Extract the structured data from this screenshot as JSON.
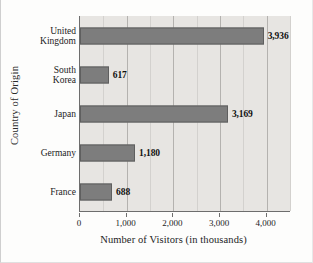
{
  "chart_data": {
    "type": "bar",
    "orientation": "horizontal",
    "title": "",
    "xlabel": "Number of Visitors (in thousands)",
    "ylabel": "Country of Origin",
    "categories": [
      "United Kingdom",
      "South Korea",
      "Japan",
      "Germany",
      "France"
    ],
    "values": [
      3936,
      617,
      3169,
      1180,
      688
    ],
    "value_labels": [
      "3,936",
      "617",
      "3,169",
      "1,180",
      "688"
    ],
    "xlim": [
      0,
      4500
    ],
    "xticks": [
      0,
      1000,
      2000,
      3000,
      4000
    ],
    "xtick_labels": [
      "0",
      "1,000",
      "2,000",
      "3,000",
      "4,000"
    ],
    "minor_xticks": [
      500,
      1500,
      2500,
      3500,
      4500
    ],
    "grid": "vertical",
    "legend": "none",
    "bar_color": "#7d7d7d",
    "plot_background": "#e7e5e2",
    "figure_background": "#fdfdfc",
    "gridline_color": "#b4b2af"
  }
}
